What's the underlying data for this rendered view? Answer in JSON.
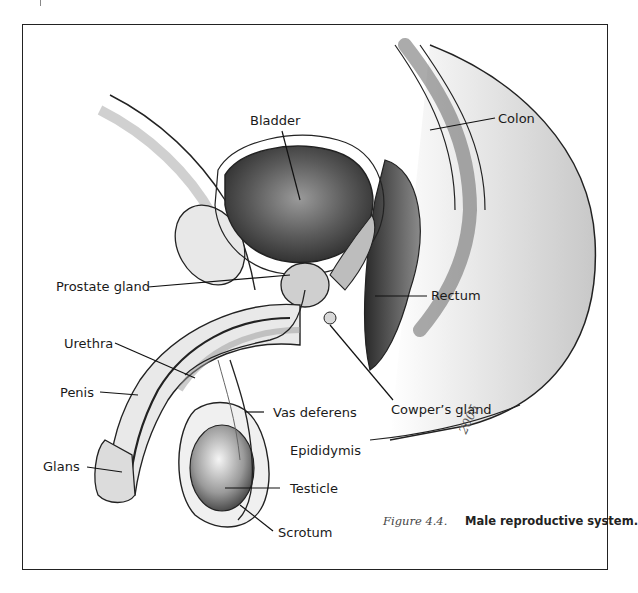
{
  "figure": {
    "number": "Figure 4.4.",
    "title": "Male reproductive system.",
    "artist_signature": "2005"
  },
  "labels": [
    {
      "id": "bladder",
      "text": "Bladder"
    },
    {
      "id": "colon",
      "text": "Colon"
    },
    {
      "id": "prostate",
      "text": "Prostate gland"
    },
    {
      "id": "rectum",
      "text": "Rectum"
    },
    {
      "id": "urethra",
      "text": "Urethra"
    },
    {
      "id": "penis",
      "text": "Penis"
    },
    {
      "id": "cowpers",
      "text": "Cowper’s gland"
    },
    {
      "id": "vas",
      "text": "Vas deferens"
    },
    {
      "id": "epididymis",
      "text": "Epididymis"
    },
    {
      "id": "glans",
      "text": "Glans"
    },
    {
      "id": "testicle",
      "text": "Testicle"
    },
    {
      "id": "scrotum",
      "text": "Scrotum"
    }
  ],
  "colors": {
    "frame": "#222222",
    "line": "#1a1a1a",
    "tissue_light": "#e6e6e6",
    "tissue_mid": "#bdbdbd",
    "tissue_dark": "#4a4a4a"
  }
}
